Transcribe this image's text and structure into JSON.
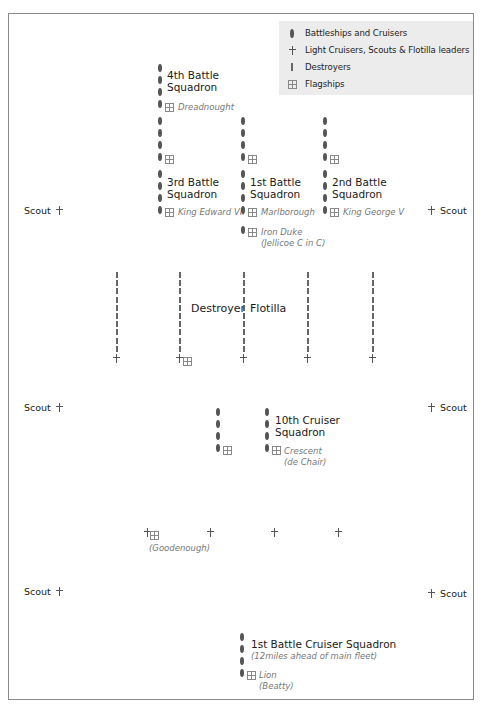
{
  "legend": {
    "items": [
      {
        "symbol": "battleship-oval",
        "label": "Battleships and Cruisers"
      },
      {
        "symbol": "light-cruiser-cross",
        "label": "Light Cruisers, Scouts & Flotilla leaders"
      },
      {
        "symbol": "destroyer-dash",
        "label": "Destroyers"
      },
      {
        "symbol": "flagship-grid",
        "label": "Flagships"
      }
    ]
  },
  "squadrons": {
    "fourth_battle": {
      "name_line1": "4th Battle",
      "name_line2": "Squadron",
      "flagship": "Dreadnought"
    },
    "third_battle": {
      "name_line1": "3rd Battle",
      "name_line2": "Squadron",
      "flagship": "King Edward VII"
    },
    "first_battle": {
      "name_line1": "1st Battle",
      "name_line2": "Squadron",
      "flagship": "Marlborough"
    },
    "second_battle": {
      "name_line1": "2nd Battle",
      "name_line2": "Squadron",
      "flagship": "King George V"
    },
    "fleet_flagship": {
      "name": "Iron Duke",
      "commander": "(Jellicoe C in C)"
    },
    "destroyer_flotilla": {
      "word1": "Destroyer",
      "word2": "Flotilla"
    },
    "tenth_cruiser": {
      "name_line1": "10th Cruiser",
      "name_line2": "Squadron",
      "flagship": "Crescent",
      "commander": "(de Chair)"
    },
    "light_cruisers": {
      "commander": "(Goodenough)"
    },
    "first_battle_cruiser": {
      "name": "1st Battle Cruiser Squadron",
      "note": "(12miles ahead of main fleet)",
      "flagship": "Lion",
      "commander": "(Beatty)"
    }
  },
  "scouts": {
    "label": "Scout"
  },
  "colors": {
    "ship": "#555555",
    "legend_bg": "#ececec",
    "frame": "#8a8a8a",
    "italic": "#777777"
  }
}
